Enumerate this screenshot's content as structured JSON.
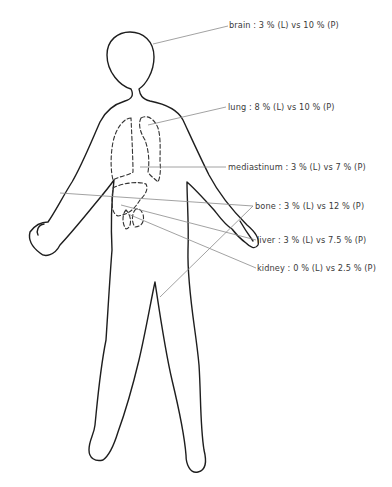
{
  "diagram": {
    "type": "anatomical-body-outline",
    "legend_abbrev": {
      "L": "L",
      "P": "P"
    },
    "labels": [
      {
        "id": "brain",
        "text": "brain : 3 % (L) vs 10 % (P)",
        "organ": "brain",
        "L_percent": 3,
        "P_percent": 10
      },
      {
        "id": "lung",
        "text": "lung : 8 % (L) vs 10 % (P)",
        "organ": "lung",
        "L_percent": 8,
        "P_percent": 10
      },
      {
        "id": "mediastinum",
        "text": "mediastinum : 3 % (L) vs 7 % (P)",
        "organ": "mediastinum",
        "L_percent": 3,
        "P_percent": 7
      },
      {
        "id": "bone",
        "text": "bone : 3 % (L) vs 12 % (P)",
        "organ": "bone",
        "L_percent": 3,
        "P_percent": 12
      },
      {
        "id": "liver",
        "text": "liver : 3 % (L) vs 7.5 % (P)",
        "organ": "liver",
        "L_percent": 3,
        "P_percent": 7.5
      },
      {
        "id": "kidney",
        "text": "kidney : 0 % (L) vs 2.5 % (P)",
        "organ": "kidney",
        "L_percent": 0,
        "P_percent": 2.5
      }
    ],
    "colors": {
      "outline": "#1e1e1e",
      "leader": "#8a8a8a",
      "text": "#3a3a3a",
      "background": "#ffffff"
    }
  }
}
